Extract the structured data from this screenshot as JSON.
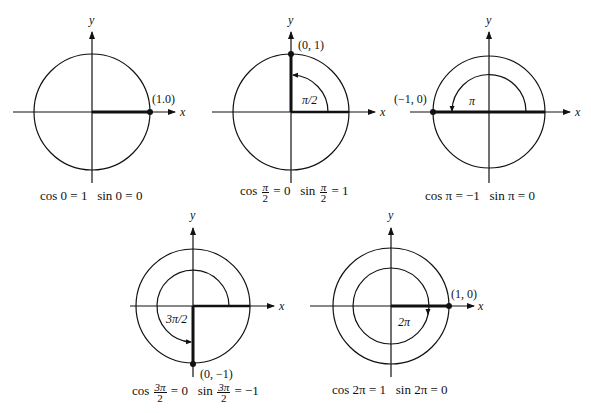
{
  "figures": [
    {
      "id": "angle-0",
      "center": [
        92,
        112
      ],
      "radius": 58,
      "point_label": "(1.0)",
      "angle_label": "",
      "axis_x": "x",
      "axis_y": "y",
      "caption": {
        "cos": "cos 0 = 1",
        "sin": "sin 0 = 0"
      }
    },
    {
      "id": "angle-pi-over-2",
      "center": [
        291,
        112
      ],
      "radius": 58,
      "point_label": "(0, 1)",
      "angle_label": "π/2",
      "axis_x": "x",
      "axis_y": "y",
      "caption": {
        "cos_prefix": "cos",
        "cos_num": "π",
        "cos_den": "2",
        "cos_rhs": "= 0",
        "sin_prefix": "sin",
        "sin_num": "π",
        "sin_den": "2",
        "sin_rhs": "= 1"
      }
    },
    {
      "id": "angle-pi",
      "center": [
        489,
        112
      ],
      "radius": 56,
      "point_label": "(−1, 0)",
      "angle_label": "π",
      "axis_x": "x",
      "axis_y": "y",
      "caption": {
        "cos": "cos π = −1",
        "sin": "sin π = 0"
      }
    },
    {
      "id": "angle-3pi-over-2",
      "center": [
        193,
        306
      ],
      "radius": 57,
      "point_label": "(0, −1)",
      "angle_label": "3π/2",
      "axis_x": "x",
      "axis_y": "y",
      "caption": {
        "cos_prefix": "cos",
        "cos_num": "3π",
        "cos_den": "2",
        "cos_rhs": "= 0",
        "sin_prefix": "sin",
        "sin_num": "3π",
        "sin_den": "2",
        "sin_rhs": "= −1"
      }
    },
    {
      "id": "angle-2pi",
      "center": [
        391,
        306
      ],
      "radius": 58,
      "point_label": "(1, 0)",
      "angle_label": "2π",
      "axis_x": "x",
      "axis_y": "y",
      "caption": {
        "cos": "cos 2π = 1",
        "sin": "sin 2π = 0"
      }
    }
  ]
}
